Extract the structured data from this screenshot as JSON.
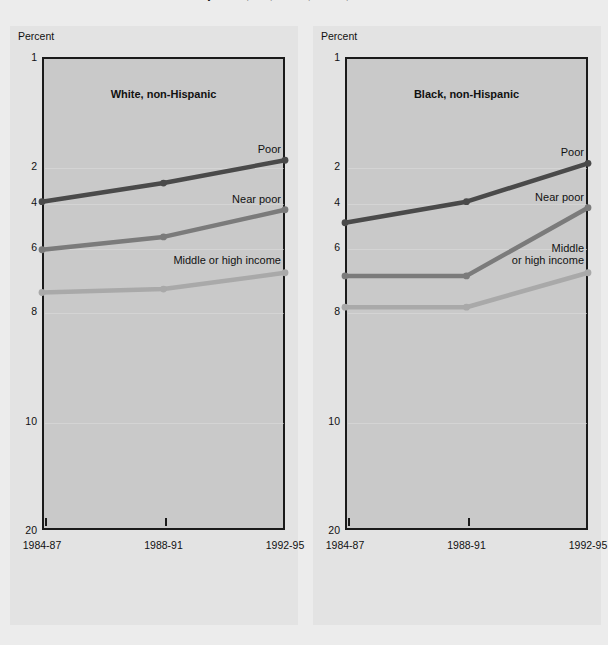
{
  "page": {
    "cut_off_title": "Gross of family income, race, 1984-87, 1988-91, and 1992-95 — Continued",
    "background_color": "#ececec",
    "panel_background_color": "#e3e3e3",
    "plot_background_color": "#c9c9c9"
  },
  "axis": {
    "unit_label": "Percent",
    "y_ticks": [
      "20",
      "10",
      "8",
      "6",
      "4",
      "2",
      "1"
    ],
    "y_tick_values": [
      20,
      10,
      8,
      6,
      4,
      2,
      1
    ],
    "x_ticks": [
      "1984-87",
      "1988-91",
      "1992-95"
    ],
    "scale": "log"
  },
  "series_colors": {
    "poor": "#4a4a4a",
    "near_poor": "#7b7b7b",
    "middle_or_high_income": "#a9a9a9"
  },
  "chart_data": [
    {
      "type": "line",
      "title": "White, non-Hispanic",
      "xlabel": "",
      "ylabel": "Percent",
      "yscale": "log",
      "ylim": [
        1,
        20
      ],
      "ytick_values": [
        1,
        2,
        4,
        6,
        8,
        10,
        20
      ],
      "grid": true,
      "legend_position": "inline-right",
      "categories": [
        "1984-87",
        "1988-91",
        "1992-95"
      ],
      "series": [
        {
          "name": "Poor",
          "values": [
            8.0,
            9.0,
            10.4
          ],
          "color": "#4a4a4a"
        },
        {
          "name": "Near poor",
          "values": [
            5.9,
            6.4,
            7.6
          ],
          "color": "#7b7b7b"
        },
        {
          "name": "Middle or high income",
          "values": [
            4.5,
            4.6,
            5.1
          ],
          "color": "#a9a9a9"
        }
      ]
    },
    {
      "type": "line",
      "title": "Black, non-Hispanic",
      "xlabel": "",
      "ylabel": "Percent",
      "yscale": "log",
      "ylim": [
        1,
        20
      ],
      "ytick_values": [
        1,
        2,
        4,
        6,
        8,
        10,
        20
      ],
      "grid": true,
      "legend_position": "inline-right",
      "categories": [
        "1984-87",
        "1988-91",
        "1992-95"
      ],
      "series": [
        {
          "name": "Poor",
          "values": [
            7.0,
            8.0,
            10.2
          ],
          "color": "#4a4a4a"
        },
        {
          "name": "Near poor",
          "values": [
            5.0,
            5.0,
            7.7
          ],
          "color": "#7b7b7b"
        },
        {
          "name": "Middle\nor high income",
          "values": [
            4.1,
            4.1,
            5.1
          ],
          "color": "#a9a9a9"
        }
      ]
    }
  ]
}
